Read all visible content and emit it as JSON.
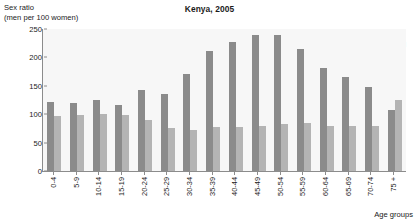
{
  "chart_data": {
    "type": "bar",
    "title": "Kenya, 2005",
    "ylabel_line1": "Sex ratio",
    "ylabel_line2": "(men per 100 women)",
    "xlabel": "Age groups",
    "ylim": [
      0,
      250
    ],
    "yticks": [
      250,
      200,
      150,
      100,
      50,
      0
    ],
    "grid": false,
    "legend_position": "top-right",
    "categories": [
      "0-4",
      "5-9",
      "10-14",
      "15-19",
      "20-24",
      "25-29",
      "30-34",
      "35-39",
      "40-44",
      "45-49",
      "50-54",
      "55-59",
      "60-64",
      "65-69",
      "70-74",
      "75 +"
    ],
    "series": [
      {
        "name": "Urban",
        "color": "#8b8b8b",
        "values": [
          122,
          120,
          125,
          117,
          143,
          135,
          170,
          212,
          228,
          240,
          239,
          215,
          181,
          165,
          148,
          108
        ]
      },
      {
        "name": "Rural",
        "color": "#b4b4b4",
        "values": [
          97,
          99,
          100,
          99,
          90,
          75,
          72,
          78,
          78,
          80,
          82,
          85,
          80,
          79,
          80,
          125
        ]
      }
    ]
  }
}
